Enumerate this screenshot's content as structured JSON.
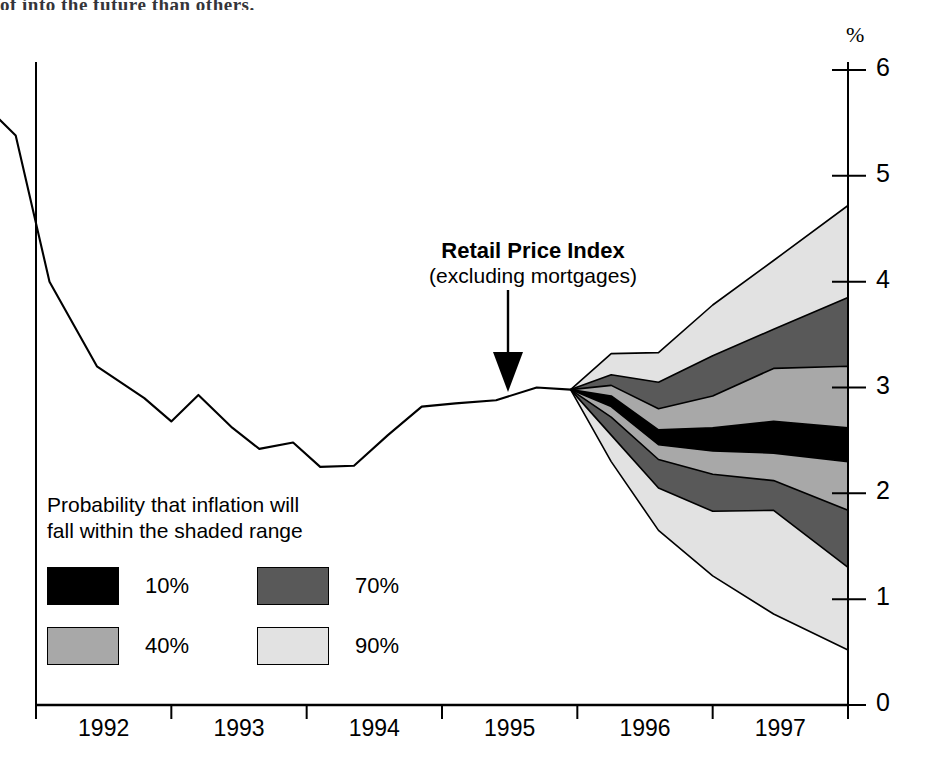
{
  "page": {
    "cut_off_top_text": "of into the future than others."
  },
  "axes": {
    "y_unit_label": "%",
    "y_ticks": [
      "0",
      "1",
      "2",
      "3",
      "4",
      "5",
      "6"
    ],
    "x_ticks": [
      "1992",
      "1993",
      "1994",
      "1995",
      "1996",
      "1997"
    ]
  },
  "annotation": {
    "line1": "Retail Price Index",
    "line2": "(excluding mortgages)",
    "arrow": "down-arrow"
  },
  "legend": {
    "title": "Probability that inflation will\nfall within the shaded range",
    "items": [
      {
        "label": "10%",
        "color": "#000000"
      },
      {
        "label": "70%",
        "color": "#595959"
      },
      {
        "label": "40%",
        "color": "#a8a8a8"
      },
      {
        "label": "90%",
        "color": "#e2e2e2"
      }
    ]
  },
  "colors": {
    "band_10": "#000000",
    "band_40": "#a8a8a8",
    "band_70": "#595959",
    "band_90": "#e2e2e2",
    "line": "#000000",
    "axis": "#000000",
    "background": "#ffffff"
  },
  "chart_data": {
    "type": "area",
    "xlabel": "",
    "ylabel": "%",
    "xlim": [
      1991.55,
      1998.0
    ],
    "ylim": [
      0,
      6
    ],
    "grid": false,
    "legend_position": "lower-left-inside",
    "x_tick_values": [
      1992,
      1993,
      1994,
      1995,
      1996,
      1997,
      1998
    ],
    "y_tick_values": [
      0,
      1,
      2,
      3,
      4,
      5,
      6
    ],
    "history": {
      "name": "RPI excluding mortgages (actual)",
      "x": [
        1991.6,
        1991.85,
        1992.1,
        1992.45,
        1992.8,
        1993.0,
        1993.2,
        1993.45,
        1993.65,
        1993.9,
        1994.1,
        1994.35,
        1994.6,
        1994.85,
        1995.1,
        1995.4,
        1995.7,
        1995.95
      ],
      "y": [
        5.7,
        5.38,
        4.0,
        3.2,
        2.9,
        2.68,
        2.93,
        2.62,
        2.42,
        2.48,
        2.25,
        2.26,
        2.55,
        2.82,
        2.85,
        2.88,
        3.0,
        2.98
      ]
    },
    "fan": {
      "origin": {
        "x": 1995.95,
        "y": 2.98
      },
      "x": [
        1995.95,
        1996.25,
        1996.6,
        1997.0,
        1997.45,
        1998.0
      ],
      "bands": [
        {
          "name": "90%",
          "probability": 90,
          "color": "#e2e2e2",
          "upper": [
            2.98,
            3.32,
            3.33,
            3.78,
            4.2,
            4.72
          ],
          "lower": [
            2.98,
            2.3,
            1.65,
            1.22,
            0.86,
            0.52
          ]
        },
        {
          "name": "70%",
          "probability": 70,
          "color": "#595959",
          "upper": [
            2.98,
            3.12,
            3.05,
            3.3,
            3.55,
            3.85
          ],
          "lower": [
            2.98,
            2.55,
            2.05,
            1.83,
            1.84,
            1.3
          ]
        },
        {
          "name": "40%",
          "probability": 40,
          "color": "#a8a8a8",
          "upper": [
            2.98,
            3.02,
            2.8,
            2.92,
            3.18,
            3.2
          ],
          "lower": [
            2.98,
            2.72,
            2.32,
            2.18,
            2.12,
            1.84
          ]
        },
        {
          "name": "10%",
          "probability": 10,
          "color": "#000000",
          "upper": [
            2.98,
            2.92,
            2.6,
            2.62,
            2.68,
            2.62
          ],
          "lower": [
            2.98,
            2.82,
            2.46,
            2.4,
            2.38,
            2.3
          ]
        }
      ]
    }
  }
}
